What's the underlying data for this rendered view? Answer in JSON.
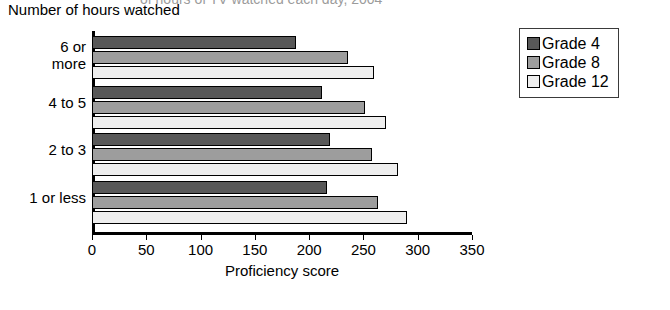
{
  "clipped_title": "of hours of TV watched each day, 2004",
  "y_axis_title": "Number of hours watched",
  "legend": {
    "items": [
      {
        "label": "Grade 4",
        "color": "#585858",
        "swatch_name": "legend-swatch-grade-4"
      },
      {
        "label": "Grade 8",
        "color": "#9d9d9d",
        "swatch_name": "legend-swatch-grade-8"
      },
      {
        "label": "Grade 12",
        "color": "#eeeeee",
        "swatch_name": "legend-swatch-grade-12"
      }
    ]
  },
  "chart_data": {
    "type": "bar",
    "orientation": "horizontal",
    "title": "of hours of TV watched each day, 2004",
    "xlabel": "Proficiency score",
    "ylabel": "Number of hours watched",
    "xlim": [
      0,
      350
    ],
    "xticks": [
      0,
      50,
      100,
      150,
      200,
      250,
      300,
      350
    ],
    "grid": false,
    "legend_position": "right",
    "categories": [
      "6 or more",
      "4 to 5",
      "2 to 3",
      "1 or less"
    ],
    "series": [
      {
        "name": "Grade 4",
        "color": "#585858",
        "values": [
          188,
          212,
          219,
          216
        ]
      },
      {
        "name": "Grade 8",
        "color": "#9d9d9d",
        "values": [
          236,
          251,
          258,
          263
        ]
      },
      {
        "name": "Grade 12",
        "color": "#eeeeee",
        "values": [
          260,
          271,
          282,
          290
        ]
      }
    ]
  }
}
